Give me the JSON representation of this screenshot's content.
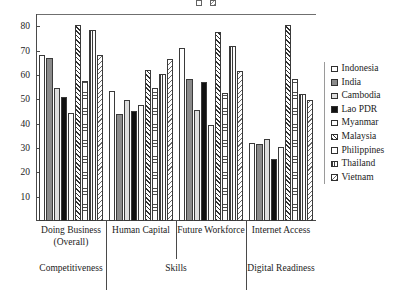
{
  "chart_data": {
    "type": "bar",
    "title": "",
    "xlabel": "",
    "ylabel": "",
    "ylim": [
      0,
      85
    ],
    "yticks": [
      10,
      20,
      30,
      40,
      50,
      60,
      70,
      80
    ],
    "grid": false,
    "legend_position": "right",
    "categories": [
      "Doing Business (Overall)",
      "Human Capital",
      "Future Workforce",
      "Internet Access"
    ],
    "parent_categories": [
      {
        "label": "Competitiveness",
        "span": 1
      },
      {
        "label": "Skills",
        "span": 2
      },
      {
        "label": "Digital Readiness",
        "span": 1
      }
    ],
    "series": [
      {
        "name": "Indonesia",
        "pattern": "open",
        "values": [
          68,
          53.5,
          71,
          32
        ]
      },
      {
        "name": "India",
        "pattern": "grey",
        "values": [
          67,
          44,
          58.5,
          31.5
        ]
      },
      {
        "name": "Cambodia",
        "pattern": "light",
        "values": [
          54.5,
          49.5,
          45.5,
          33.5
        ]
      },
      {
        "name": "Lao PDR",
        "pattern": "black",
        "values": [
          51,
          45,
          57,
          25.5
        ]
      },
      {
        "name": "Myanmar",
        "pattern": "open2",
        "values": [
          44.5,
          47.5,
          39.5,
          30.5
        ]
      },
      {
        "name": "Malaysia",
        "pattern": "diag",
        "values": [
          80.5,
          62,
          77.5,
          80.5
        ]
      },
      {
        "name": "Philippines",
        "pattern": "dot",
        "values": [
          57.5,
          54.5,
          52.5,
          58.5
        ]
      },
      {
        "name": "Thailand",
        "pattern": "vert",
        "values": [
          78.5,
          60.5,
          72,
          52
        ]
      },
      {
        "name": "Vietnam",
        "pattern": "sdot",
        "values": [
          68,
          66.5,
          61.5,
          49.5
        ]
      }
    ]
  }
}
